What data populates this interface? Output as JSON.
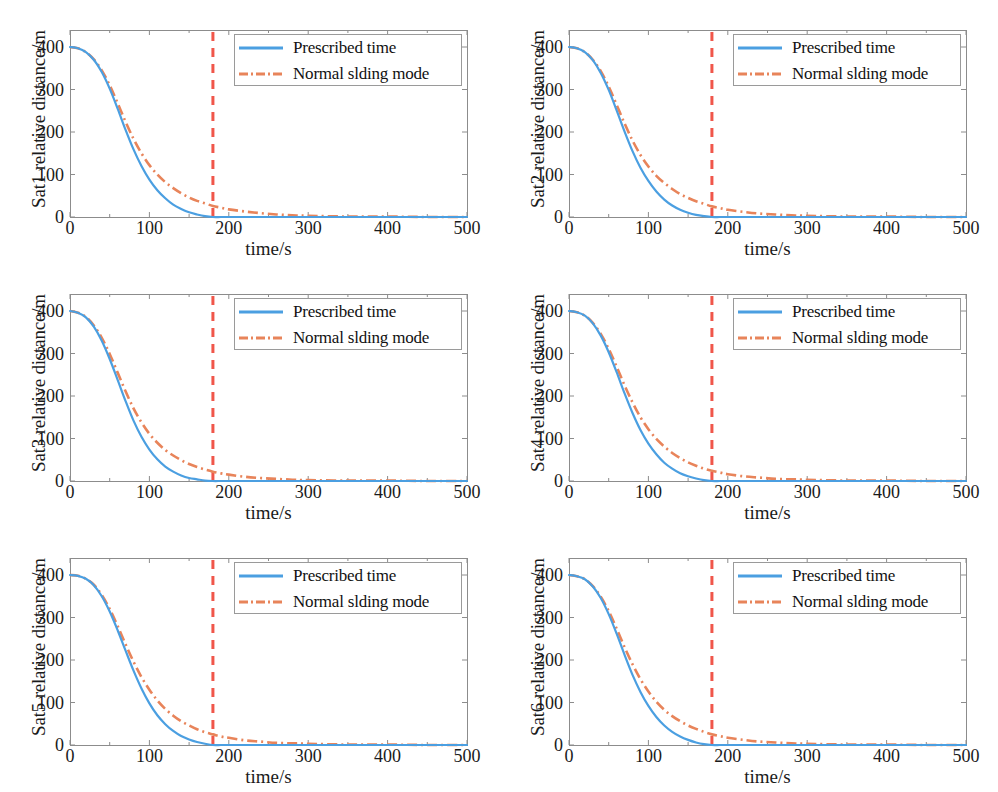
{
  "figure": {
    "rows": 3,
    "cols": 2,
    "width": 998,
    "height": 792
  },
  "style": {
    "color_prescribed": "#4B9FE1",
    "color_sliding": "#E8845A",
    "color_marker_line": "#F0564A",
    "color_axis": "#8c8c8c",
    "color_text": "#1a1a1a",
    "color_legend_border": "#9a9a9a",
    "background": "#ffffff"
  },
  "legend": {
    "position": "top-right",
    "entries": [
      {
        "label": "Prescribed time",
        "style": "solid",
        "color": "#4B9FE1"
      },
      {
        "label": "Normal slding mode",
        "style": "dash-dot",
        "color": "#E8845A"
      }
    ]
  },
  "axes": {
    "xlabel": "time/s",
    "xticks": [
      "0",
      "100",
      "200",
      "300",
      "400",
      "500"
    ],
    "xtick_values": [
      0,
      100,
      200,
      300,
      400,
      500
    ],
    "xlim": [
      0,
      500
    ],
    "yticks": [
      "0",
      "100",
      "200",
      "300",
      "400"
    ],
    "ytick_values": [
      0,
      100,
      200,
      300,
      400
    ],
    "ylim": [
      0,
      440
    ],
    "grid": false
  },
  "marker": {
    "label": "prescribed settling time",
    "t": 180,
    "style": "dashed-vertical",
    "color": "#F0564A"
  },
  "chart_data": [
    {
      "type": "line",
      "title": "",
      "panel": 1,
      "xlabel": "time/s",
      "ylabel": "Sat1 relative distance/m",
      "xlim": [
        0,
        500
      ],
      "ylim": [
        0,
        440
      ],
      "grid": false,
      "vline": 180,
      "x": [
        0,
        10,
        20,
        30,
        40,
        50,
        60,
        70,
        80,
        90,
        100,
        110,
        120,
        130,
        140,
        150,
        160,
        170,
        180,
        190,
        200,
        220,
        240,
        260,
        280,
        300,
        350,
        400,
        450,
        500
      ],
      "series": [
        {
          "name": "Prescribed time",
          "values": [
            400,
            397,
            388,
            370,
            341,
            302,
            255,
            205,
            159,
            120,
            88,
            63,
            44,
            29,
            19,
            11,
            6,
            2,
            0,
            0,
            0,
            0,
            0,
            0,
            0,
            0,
            0,
            0,
            0,
            0
          ]
        },
        {
          "name": "Normal slding mode",
          "values": [
            400,
            397,
            388,
            371,
            345,
            310,
            268,
            224,
            184,
            150,
            122,
            100,
            82,
            68,
            56,
            46,
            38,
            32,
            26,
            22,
            18,
            13,
            9,
            6,
            4,
            3,
            1,
            1,
            0,
            0
          ]
        }
      ]
    },
    {
      "type": "line",
      "title": "",
      "panel": 2,
      "xlabel": "time/s",
      "ylabel": "Sat2 relative distance/m",
      "xlim": [
        0,
        500
      ],
      "ylim": [
        0,
        440
      ],
      "grid": false,
      "vline": 180,
      "x": [
        0,
        10,
        20,
        30,
        40,
        50,
        60,
        70,
        80,
        90,
        100,
        110,
        120,
        130,
        140,
        150,
        160,
        170,
        180,
        190,
        200,
        220,
        240,
        260,
        280,
        300,
        350,
        400,
        450,
        500
      ],
      "series": [
        {
          "name": "Prescribed time",
          "values": [
            400,
            397,
            388,
            369,
            339,
            299,
            251,
            201,
            155,
            116,
            85,
            60,
            41,
            27,
            17,
            10,
            5,
            2,
            0,
            0,
            0,
            0,
            0,
            0,
            0,
            0,
            0,
            0,
            0,
            0
          ]
        },
        {
          "name": "Normal slding mode",
          "values": [
            400,
            397,
            388,
            370,
            343,
            307,
            264,
            220,
            180,
            146,
            119,
            97,
            80,
            66,
            54,
            45,
            37,
            31,
            25,
            21,
            17,
            12,
            8,
            6,
            4,
            3,
            1,
            1,
            0,
            0
          ]
        }
      ]
    },
    {
      "type": "line",
      "title": "",
      "panel": 3,
      "xlabel": "time/s",
      "ylabel": "Sat3 relative distance/m",
      "xlim": [
        0,
        500
      ],
      "ylim": [
        0,
        440
      ],
      "grid": false,
      "vline": 180,
      "x": [
        0,
        10,
        20,
        30,
        40,
        50,
        60,
        70,
        80,
        90,
        100,
        110,
        120,
        130,
        140,
        150,
        160,
        170,
        180,
        190,
        200,
        220,
        240,
        260,
        280,
        300,
        350,
        400,
        450,
        500
      ],
      "series": [
        {
          "name": "Prescribed time",
          "values": [
            400,
            396,
            385,
            363,
            330,
            287,
            238,
            188,
            142,
            104,
            74,
            51,
            34,
            22,
            13,
            7,
            4,
            1,
            0,
            0,
            0,
            0,
            0,
            0,
            0,
            0,
            0,
            0,
            0,
            0
          ]
        },
        {
          "name": "Normal slding mode",
          "values": [
            400,
            396,
            386,
            366,
            337,
            299,
            255,
            211,
            171,
            138,
            111,
            90,
            73,
            60,
            49,
            40,
            33,
            27,
            22,
            18,
            15,
            10,
            7,
            5,
            3,
            2,
            1,
            1,
            0,
            0
          ]
        }
      ]
    },
    {
      "type": "line",
      "title": "",
      "panel": 4,
      "xlabel": "time/s",
      "ylabel": "Sat4 relative distance/m",
      "xlim": [
        0,
        500
      ],
      "ylim": [
        0,
        440
      ],
      "grid": false,
      "vline": 180,
      "x": [
        0,
        10,
        20,
        30,
        40,
        50,
        60,
        70,
        80,
        90,
        100,
        110,
        120,
        130,
        140,
        150,
        160,
        170,
        180,
        190,
        200,
        220,
        240,
        260,
        280,
        300,
        350,
        400,
        450,
        500
      ],
      "series": [
        {
          "name": "Prescribed time",
          "values": [
            400,
            397,
            389,
            371,
            342,
            303,
            256,
            206,
            160,
            120,
            88,
            63,
            43,
            29,
            18,
            11,
            6,
            2,
            0,
            0,
            0,
            0,
            0,
            0,
            0,
            0,
            0,
            0,
            0,
            0
          ]
        },
        {
          "name": "Normal slding mode",
          "values": [
            400,
            397,
            389,
            372,
            346,
            311,
            269,
            225,
            185,
            150,
            122,
            99,
            81,
            66,
            54,
            44,
            36,
            29,
            24,
            20,
            16,
            11,
            8,
            5,
            4,
            3,
            1,
            1,
            0,
            0
          ]
        }
      ]
    },
    {
      "type": "line",
      "title": "",
      "panel": 5,
      "xlabel": "time/s",
      "ylabel": "Sat5 relative distance/m",
      "xlim": [
        0,
        500
      ],
      "ylim": [
        0,
        440
      ],
      "grid": false,
      "vline": 180,
      "x": [
        0,
        10,
        20,
        30,
        40,
        50,
        60,
        70,
        80,
        90,
        100,
        110,
        120,
        130,
        140,
        150,
        160,
        170,
        180,
        190,
        200,
        220,
        240,
        260,
        280,
        300,
        350,
        400,
        450,
        500
      ],
      "series": [
        {
          "name": "Prescribed time",
          "values": [
            400,
            398,
            391,
            376,
            350,
            314,
            270,
            222,
            175,
            133,
            98,
            70,
            49,
            33,
            21,
            13,
            7,
            3,
            0,
            0,
            0,
            0,
            0,
            0,
            0,
            0,
            0,
            0,
            0,
            0
          ]
        },
        {
          "name": "Normal slding mode",
          "values": [
            400,
            398,
            391,
            377,
            353,
            320,
            280,
            237,
            196,
            160,
            130,
            105,
            85,
            69,
            56,
            46,
            37,
            30,
            25,
            20,
            17,
            11,
            8,
            5,
            4,
            3,
            1,
            1,
            0,
            0
          ]
        }
      ]
    },
    {
      "type": "line",
      "title": "",
      "panel": 6,
      "xlabel": "time/s",
      "ylabel": "Sat6 relative distance/m",
      "xlim": [
        0,
        500
      ],
      "ylim": [
        0,
        440
      ],
      "grid": false,
      "vline": 180,
      "x": [
        0,
        10,
        20,
        30,
        40,
        50,
        60,
        70,
        80,
        90,
        100,
        110,
        120,
        130,
        140,
        150,
        160,
        170,
        180,
        190,
        200,
        220,
        240,
        260,
        280,
        300,
        350,
        400,
        450,
        500
      ],
      "series": [
        {
          "name": "Prescribed time",
          "values": [
            400,
            397,
            390,
            373,
            346,
            308,
            262,
            212,
            165,
            125,
            92,
            66,
            46,
            31,
            20,
            12,
            6,
            2,
            0,
            0,
            0,
            0,
            0,
            0,
            0,
            0,
            0,
            0,
            0,
            0
          ]
        },
        {
          "name": "Normal slding mode",
          "values": [
            400,
            397,
            390,
            374,
            349,
            315,
            274,
            230,
            190,
            155,
            126,
            102,
            83,
            68,
            56,
            46,
            38,
            31,
            25,
            21,
            17,
            12,
            8,
            6,
            4,
            3,
            1,
            1,
            0,
            0
          ]
        }
      ]
    }
  ]
}
